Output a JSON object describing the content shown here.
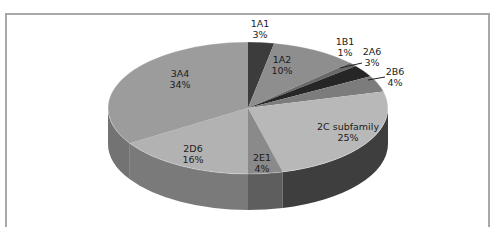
{
  "chart_data": {
    "type": "pie",
    "style": "3d",
    "title": "",
    "categories": [
      "1A1",
      "1A2",
      "1B1",
      "2A6",
      "2B6",
      "2C subfamily",
      "2E1",
      "2D6",
      "3A4"
    ],
    "values": [
      3,
      10,
      1,
      3,
      4,
      25,
      4,
      16,
      34
    ],
    "unit": "%",
    "labels": [
      {
        "name": "1A1",
        "pct": "3%"
      },
      {
        "name": "1A2",
        "pct": "10%"
      },
      {
        "name": "1B1",
        "pct": "1%"
      },
      {
        "name": "2A6",
        "pct": "3%"
      },
      {
        "name": "2B6",
        "pct": "4%"
      },
      {
        "name": "2C subfamily",
        "pct": "25%"
      },
      {
        "name": "2E1",
        "pct": "4%"
      },
      {
        "name": "2D6",
        "pct": "16%"
      },
      {
        "name": "3A4",
        "pct": "34%"
      }
    ],
    "colors": [
      "#3c3c3c",
      "#8e8e8e",
      "#6a6a6a",
      "#262626",
      "#7c7c7c",
      "#b8b8b8",
      "#8a8a8a",
      "#b2b2b2",
      "#9c9c9c"
    ],
    "side_colors": [
      "#2c2c2c",
      "#6a6a6a",
      "#4e4e4e",
      "#1a1a1a",
      "#5a5a5a",
      "#3e3e3e",
      "#5e5e5e",
      "#7a7a7a",
      "#737373"
    ],
    "legend": "none",
    "start_angle_deg": 0,
    "direction": "clockwise"
  }
}
